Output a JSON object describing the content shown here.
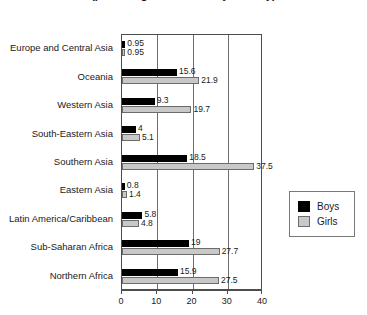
{
  "chart_data": {
    "type": "bar",
    "orientation": "horizontal",
    "title": "(percentage of children by country)",
    "xlabel": "",
    "ylabel": "",
    "xlim": [
      0,
      40
    ],
    "xticks": [
      "0",
      "10",
      "20",
      "30",
      "40"
    ],
    "grid": true,
    "legend_position": "right",
    "categories": [
      "Europe and Central Asia",
      "Oceania",
      "Western Asia",
      "South-Eastern Asia",
      "Southern Asia",
      "Eastern Asia",
      "Latin America/Caribbean",
      "Sub-Saharan Africa",
      "Northern Africa"
    ],
    "series": [
      {
        "name": "Boys",
        "color": "#000000",
        "values": [
          0.95,
          15.6,
          9.3,
          4,
          18.5,
          0.8,
          5.8,
          19,
          15.9
        ],
        "labels": [
          "0.95",
          "15.6",
          "9.3",
          "4",
          "18.5",
          "0.8",
          "5.8",
          "19",
          "15.9"
        ]
      },
      {
        "name": "Girls",
        "color": "#c8c8c8",
        "values": [
          0.95,
          21.9,
          19.7,
          5.1,
          37.5,
          1.4,
          4.8,
          27.7,
          27.5
        ],
        "labels": [
          "0.95",
          "21.9",
          "19.7",
          "5.1",
          "37.5",
          "1.4",
          "4.8",
          "27.7",
          "27.5"
        ]
      }
    ]
  },
  "legend": {
    "items": [
      {
        "label": "Boys"
      },
      {
        "label": "Girls"
      }
    ]
  }
}
